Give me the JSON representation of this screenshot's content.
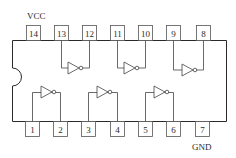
{
  "chip": {
    "type": "14-pin DIP hex inverter",
    "vcc_label": "VCC",
    "gnd_label": "GND",
    "vcc_pin": "14",
    "gnd_pin": "7"
  },
  "pins": {
    "top": [
      "14",
      "13",
      "12",
      "11",
      "10",
      "9",
      "8"
    ],
    "bottom": [
      "1",
      "2",
      "3",
      "4",
      "5",
      "6",
      "7"
    ]
  },
  "gates": [
    {
      "input": "1",
      "output": "2",
      "row": "bottom"
    },
    {
      "input": "3",
      "output": "4",
      "row": "bottom"
    },
    {
      "input": "5",
      "output": "6",
      "row": "bottom"
    },
    {
      "input": "13",
      "output": "12",
      "row": "top"
    },
    {
      "input": "11",
      "output": "10",
      "row": "top"
    },
    {
      "input": "9",
      "output": "8",
      "row": "top"
    }
  ],
  "colors": {
    "line": "#2a2a2a",
    "background": "#ffffff"
  }
}
